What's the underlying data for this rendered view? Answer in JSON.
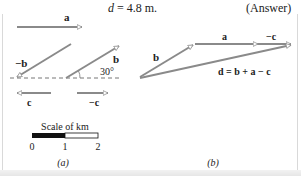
{
  "header": {
    "equation_var": "d",
    "equation_rest": " = 4.8 m.",
    "answer_label": "(Answer)"
  },
  "panel_a": {
    "vector_a_label": "a",
    "vector_neg_b_label": "−b",
    "vector_b_label": "b",
    "angle_label": "30°",
    "vector_c_label": "c",
    "vector_neg_c_label": "−c",
    "scale_title": "Scale of km",
    "scale_ticks": [
      "0",
      "1",
      "2"
    ],
    "panel_label": "(a)"
  },
  "panel_b": {
    "vector_b_label": "b",
    "vector_a_label": "a",
    "vector_neg_c_label": "−c",
    "result_label": "d = b + a − c",
    "panel_label": "(b)"
  },
  "colors": {
    "vector": "#8a8a8a",
    "text": "#222222",
    "scale_fill": "#111111",
    "border": "#d9d9d9"
  }
}
